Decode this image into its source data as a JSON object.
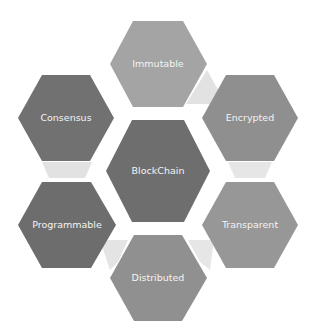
{
  "diagram": {
    "title": "BlockChain",
    "center": {
      "label": "BlockChain",
      "color": "#6e6e6e"
    },
    "nodes": [
      {
        "label": "Immutable",
        "color": "#a4a4a4"
      },
      {
        "label": "Encrypted",
        "color": "#8f8f8f"
      },
      {
        "label": "Transparent",
        "color": "#979797"
      },
      {
        "label": "Distributed",
        "color": "#909090"
      },
      {
        "label": "Programmable",
        "color": "#6d6d6d"
      },
      {
        "label": "Consensus",
        "color": "#717171"
      }
    ],
    "connector_color": "#e2e2e2"
  }
}
